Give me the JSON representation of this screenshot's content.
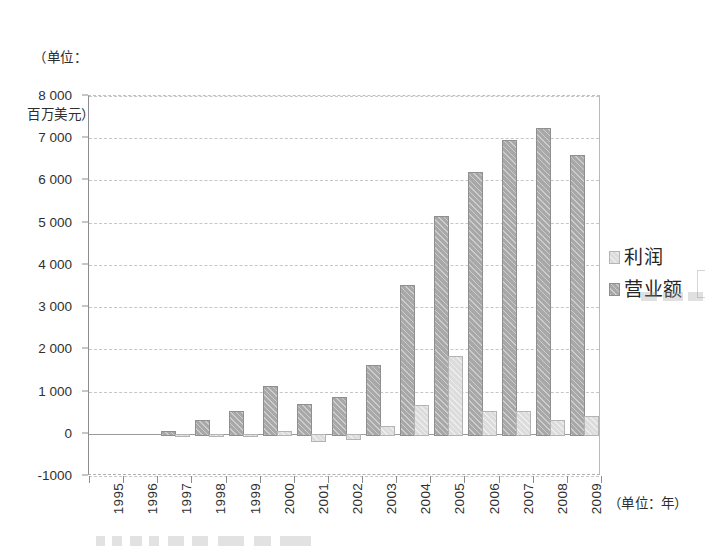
{
  "caption": {
    "line1": "（单位：",
    "line2": "百万美元）"
  },
  "axis": {
    "x_unit_label": "（单位：年）",
    "y_ticks": [
      "8 000",
      "7 000",
      "6 000",
      "5 000",
      "4 000",
      "3 000",
      "2 000",
      "1 000",
      "0",
      "-1000"
    ]
  },
  "legend": {
    "items": [
      {
        "label": "利润",
        "swatch": "profit",
        "color": "#dcdcdc"
      },
      {
        "label": "营业额",
        "swatch": "revenue",
        "color": "#a8a8a8"
      }
    ]
  },
  "chart_data": {
    "type": "bar",
    "title": "",
    "subtitle": "",
    "xlabel": "（单位：年）",
    "ylabel": "（单位：百万美元）",
    "ylim": [
      -1000,
      8000
    ],
    "ytick_step": 1000,
    "grid": true,
    "legend_position": "right",
    "categories": [
      "1995",
      "1996",
      "1997",
      "1998",
      "1999",
      "2000",
      "2001",
      "2002",
      "2003",
      "2004",
      "2005",
      "2006",
      "2007",
      "2008",
      "2009"
    ],
    "series": [
      {
        "name": "营业额",
        "color": "#a8a8a8",
        "values": [
          0,
          0,
          60,
          320,
          545,
          1120,
          700,
          880,
          1620,
          3530,
          5150,
          6200,
          6950,
          7250,
          6600
        ]
      },
      {
        "name": "利润",
        "color": "#dcdcdc",
        "values": [
          0,
          0,
          -30,
          -10,
          -15,
          55,
          -150,
          -95,
          180,
          680,
          1850,
          550,
          540,
          320,
          430
        ]
      }
    ]
  }
}
